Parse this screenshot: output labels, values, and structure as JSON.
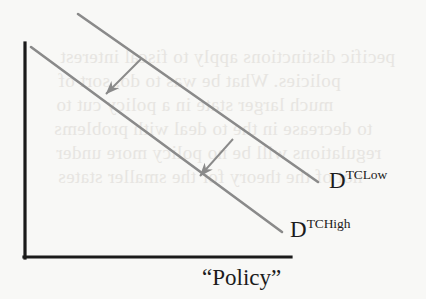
{
  "figure": {
    "kind": "economics-line-diagram",
    "background_color": "#f8f8f6",
    "axis_color": "#1a1a1a",
    "curve_color": "#8a8a8a",
    "arrow_color": "#8a8a8a",
    "label_color": "#1c1c1c",
    "bleed_color": "#e6e4e0"
  },
  "axes": {
    "x_axis_label_text": "“Policy”",
    "y_axis_label_text": "",
    "x_axis": {
      "x1": 25,
      "y1": 257,
      "x2": 290,
      "y2": 257
    },
    "y_axis": {
      "x1": 25,
      "y1": 44,
      "x2": 25,
      "y2": 257
    }
  },
  "curves": [
    {
      "id": "d-tc-low",
      "base": "D",
      "superscript": "TCLow",
      "x1": 78,
      "y1": 14,
      "x2": 318,
      "y2": 182,
      "label_x": 329,
      "label_y": 169
    },
    {
      "id": "d-tc-high",
      "base": "D",
      "superscript": "TCHigh",
      "x1": 31,
      "y1": 47,
      "x2": 282,
      "y2": 232,
      "label_x": 290,
      "label_y": 218
    }
  ],
  "arrows": [
    {
      "id": "shift-arrow-upper",
      "x1": 141,
      "y1": 59,
      "x2": 103,
      "y2": 97
    },
    {
      "id": "shift-arrow-lower",
      "x1": 233,
      "y1": 139,
      "x2": 197,
      "y2": 179
    }
  ],
  "bleed_text": {
    "note": "faint mirrored show-through from reverse page",
    "lines": [
      {
        "text": "pecific distinctions apply to fiscal interest",
        "x": 60,
        "y": 46
      },
      {
        "text": "policies. What be was to do, sort of",
        "x": 58,
        "y": 70
      },
      {
        "text": "much larger state in a policy cut to",
        "x": 56,
        "y": 94
      },
      {
        "text": "to decrease in the to deal with problems",
        "x": 54,
        "y": 118
      },
      {
        "text": "regulations will be no policy more under",
        "x": 56,
        "y": 142
      },
      {
        "text": "not of the theory for the smaller states",
        "x": 58,
        "y": 166
      }
    ]
  }
}
